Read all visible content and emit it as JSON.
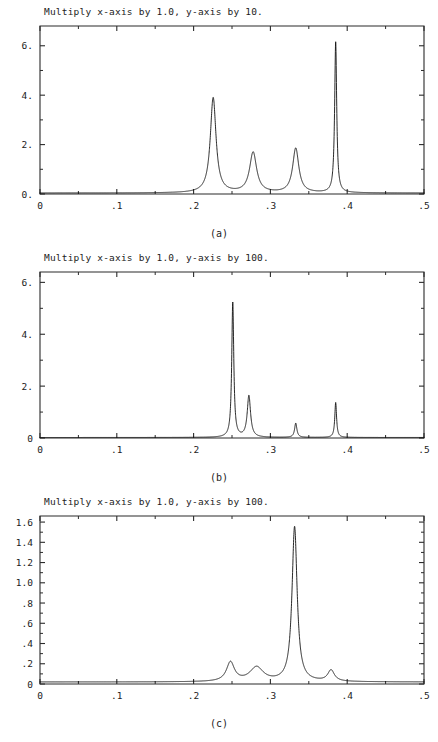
{
  "figure": {
    "background": "#ffffff",
    "ink_color": "#111111",
    "panel_count": 3
  },
  "panels": [
    {
      "id": "a",
      "caption": "(a)",
      "title": "Multiply x-axis by 1.0, y-axis by 10.",
      "chart_data": {
        "type": "line",
        "title": "Multiply x-axis by 1.0, y-axis by 10.",
        "xlabel": "",
        "ylabel": "",
        "xlim": [
          0,
          0.5
        ],
        "ylim": [
          0,
          6.8
        ],
        "grid": false,
        "legend": "none",
        "xticks": [
          0,
          0.1,
          0.2,
          0.3,
          0.4,
          0.5
        ],
        "xticklabels": [
          "0",
          ".1",
          ".2",
          ".3",
          ".4",
          ".5"
        ],
        "yticks": [
          0,
          2,
          4,
          6
        ],
        "yticklabels": [
          "0.",
          "2.",
          "4.",
          "6."
        ],
        "minor_xticks": [
          0.05,
          0.15,
          0.25,
          0.35,
          0.45
        ],
        "minor_yticks": [
          1,
          3,
          5
        ],
        "baseline": 0.04,
        "peaks": [
          {
            "center": 0.2255,
            "height": 3.85,
            "width": 0.0045
          },
          {
            "center": 0.2775,
            "height": 1.63,
            "width": 0.0055
          },
          {
            "center": 0.333,
            "height": 1.8,
            "width": 0.0048
          },
          {
            "center": 0.385,
            "height": 6.1,
            "width": 0.0016
          }
        ]
      }
    },
    {
      "id": "b",
      "caption": "(b)",
      "title": "Multiply x-axis by 1.0, y-axis by 100.",
      "chart_data": {
        "type": "line",
        "title": "Multiply x-axis by 1.0, y-axis by 100.",
        "xlabel": "",
        "ylabel": "",
        "xlim": [
          0,
          0.5
        ],
        "ylim": [
          0,
          6.4
        ],
        "grid": false,
        "legend": "none",
        "xticks": [
          0,
          0.1,
          0.2,
          0.3,
          0.4,
          0.5
        ],
        "xticklabels": [
          "0",
          ".1",
          ".2",
          ".3",
          ".4",
          ".5"
        ],
        "yticks": [
          0,
          2,
          4,
          6
        ],
        "yticklabels": [
          "0",
          "2.",
          "4.",
          "6."
        ],
        "minor_xticks": [
          0.05,
          0.15,
          0.25,
          0.35,
          0.45
        ],
        "minor_yticks": [
          1,
          3,
          5
        ],
        "baseline": 0.02,
        "peaks": [
          {
            "center": 0.251,
            "height": 5.2,
            "width": 0.0016
          },
          {
            "center": 0.272,
            "height": 1.6,
            "width": 0.0026
          },
          {
            "center": 0.333,
            "height": 0.55,
            "width": 0.0018
          },
          {
            "center": 0.385,
            "height": 1.35,
            "width": 0.0014
          }
        ]
      }
    },
    {
      "id": "c",
      "caption": "(c)",
      "title": "Multiply x-axis by 1.0, y-axis by 100.",
      "chart_data": {
        "type": "line",
        "title": "Multiply x-axis by 1.0, y-axis by 100.",
        "xlabel": "",
        "ylabel": "",
        "xlim": [
          0,
          0.5
        ],
        "ylim": [
          0,
          1.66
        ],
        "grid": false,
        "legend": "none",
        "xticks": [
          0,
          0.1,
          0.2,
          0.3,
          0.4,
          0.5
        ],
        "xticklabels": [
          "0",
          ".1",
          ".2",
          ".3",
          ".4",
          ".5"
        ],
        "yticks": [
          0,
          0.2,
          0.4,
          0.6,
          0.8,
          1.0,
          1.2,
          1.4,
          1.6
        ],
        "yticklabels": [
          "0",
          ".2",
          ".4",
          ".6",
          ".8",
          "1.0",
          "1.2",
          "1.4",
          "1.6"
        ],
        "minor_xticks": [
          0.05,
          0.15,
          0.25,
          0.35,
          0.45
        ],
        "minor_yticks": [
          0.1,
          0.3,
          0.5,
          0.7,
          0.9,
          1.1,
          1.3,
          1.5
        ],
        "baseline": 0.02,
        "peaks": [
          {
            "center": 0.248,
            "height": 0.19,
            "width": 0.0062
          },
          {
            "center": 0.282,
            "height": 0.14,
            "width": 0.0105
          },
          {
            "center": 0.3315,
            "height": 1.53,
            "width": 0.004
          },
          {
            "center": 0.379,
            "height": 0.11,
            "width": 0.0052
          }
        ]
      }
    }
  ]
}
